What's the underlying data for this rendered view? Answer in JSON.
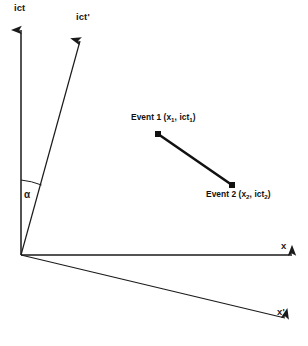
{
  "figure": {
    "type": "minkowski-spacetime-diagram",
    "width": 308,
    "height": 346,
    "background_color": "#ffffff",
    "stroke_color": "#1a1a1a"
  },
  "axes": [
    {
      "id": "ict",
      "label": "ict",
      "description": "unprimed time axis, vertical, arrow up",
      "origin": [
        21,
        255
      ],
      "tip": [
        21,
        22
      ]
    },
    {
      "id": "ict-prime",
      "label": "ict'",
      "description": "primed time axis, tilted right of vertical, arrow up-right",
      "origin": [
        21,
        255
      ],
      "tip": [
        82,
        33
      ]
    },
    {
      "id": "x",
      "label": "x",
      "description": "unprimed space axis, horizontal, arrow right",
      "origin": [
        21,
        255
      ],
      "tip": [
        301,
        255
      ]
    },
    {
      "id": "x-prime",
      "label": "x'",
      "description": "primed space axis, tilted below horizontal, arrow down-right",
      "origin": [
        21,
        255
      ],
      "tip": [
        293,
        320
      ]
    }
  ],
  "angle": {
    "symbol": "α",
    "description": "angle between ict axis and ict' axis measured at the origin"
  },
  "events": [
    {
      "id": "event-1",
      "name": "Event 1",
      "coord_open": "(",
      "coord_x": "x",
      "coord_x_sub": "1",
      "coord_sep": ", ",
      "coord_t": "ict",
      "coord_t_sub": "1",
      "coord_close": ")",
      "point": [
        158,
        134
      ]
    },
    {
      "id": "event-2",
      "name": "Event 2",
      "coord_open": "(",
      "coord_x": "x",
      "coord_x_sub": "2",
      "coord_sep": ", ",
      "coord_t": "ict",
      "coord_t_sub": "2",
      "coord_close": ")",
      "point": [
        232,
        185
      ]
    }
  ],
  "connector": {
    "description": "thick segment joining Event 1 and Event 2",
    "from": [
      158,
      134
    ],
    "to": [
      232,
      185
    ]
  }
}
